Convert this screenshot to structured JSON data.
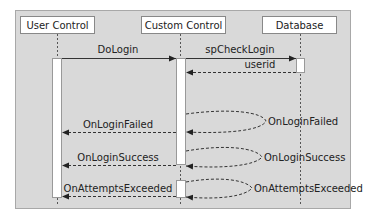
{
  "colors": {
    "frame_bg": "#d9d9d9",
    "frame_border": "#a8a8a8",
    "box_bg": "#ffffff",
    "line": "#333333"
  },
  "participants": [
    {
      "name": "User Control"
    },
    {
      "name": "Custom Control"
    },
    {
      "name": "Database"
    }
  ],
  "messages": [
    {
      "label": "DoLogin",
      "from": "User Control",
      "to": "Custom Control",
      "style": "solid"
    },
    {
      "label": "spCheckLogin",
      "from": "Custom Control",
      "to": "Database",
      "style": "solid"
    },
    {
      "label": "userid",
      "from": "Database",
      "to": "Custom Control",
      "style": "dashed"
    },
    {
      "label": "OnLoginFailed",
      "from": "Custom Control",
      "to": "Custom Control",
      "style": "dashed-self"
    },
    {
      "label": "OnLoginFailed",
      "from": "Custom Control",
      "to": "User Control",
      "style": "dashed"
    },
    {
      "label": "OnLoginSuccess",
      "from": "Custom Control",
      "to": "Custom Control",
      "style": "dashed-self"
    },
    {
      "label": "OnLoginSuccess",
      "from": "Custom Control",
      "to": "User Control",
      "style": "dashed"
    },
    {
      "label": "OnAttemptsExceeded",
      "from": "Custom Control",
      "to": "Custom Control",
      "style": "dashed-self"
    },
    {
      "label": "OnAttemptsExceeded",
      "from": "Custom Control",
      "to": "User Control",
      "style": "dashed"
    }
  ]
}
